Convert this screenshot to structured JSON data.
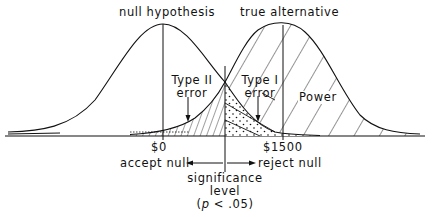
{
  "diagram": {
    "curves": [
      {
        "id": "null",
        "label": "null hypothesis",
        "mean_label": "$0"
      },
      {
        "id": "alternative",
        "label": "true alternative",
        "mean_label": "$1500"
      }
    ],
    "regions": {
      "type2": {
        "label_line1": "Type II",
        "label_line2": "error"
      },
      "type1": {
        "label_line1": "Type I",
        "label_line2": "error"
      },
      "power": {
        "label": "Power"
      }
    },
    "axis": {
      "left_label": "accept null",
      "right_label": "reject null"
    },
    "criterion": {
      "line1": "significance",
      "line2": "level",
      "line3_p": "p",
      "line3_rest": "< .05)",
      "line3_open": "("
    }
  }
}
